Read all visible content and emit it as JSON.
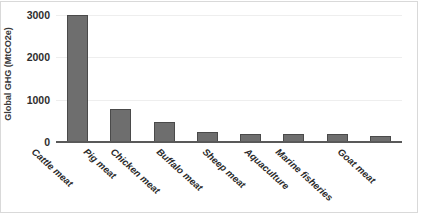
{
  "chart_data": {
    "type": "bar",
    "title": "",
    "subtitle": "",
    "xlabel": "",
    "ylabel": "Global GHG (MtCO2e)",
    "categories": [
      "Cattle meat",
      "Pig meat",
      "Chicken meat",
      "Buffalo meat",
      "Sheep meat",
      "Aquaculture",
      "Marine fisheries",
      "Goat meat"
    ],
    "values": [
      3000,
      790,
      470,
      230,
      200,
      190,
      185,
      140
    ],
    "ylim": [
      0,
      3000
    ],
    "yticks": [
      0,
      1000,
      2000,
      3000
    ],
    "ytick_labels": [
      "0",
      "1000",
      "2000",
      "3000"
    ],
    "grid": true,
    "grid_axis": "y",
    "legend": false,
    "legend_position": "none",
    "bar_color": "#6e6e6e",
    "bar_edge_color": "#4a4a4a",
    "gridline_color": "#eeeeee",
    "axis_color": "#595959",
    "plot_border_color": "#d9d9d9",
    "annotations": []
  }
}
